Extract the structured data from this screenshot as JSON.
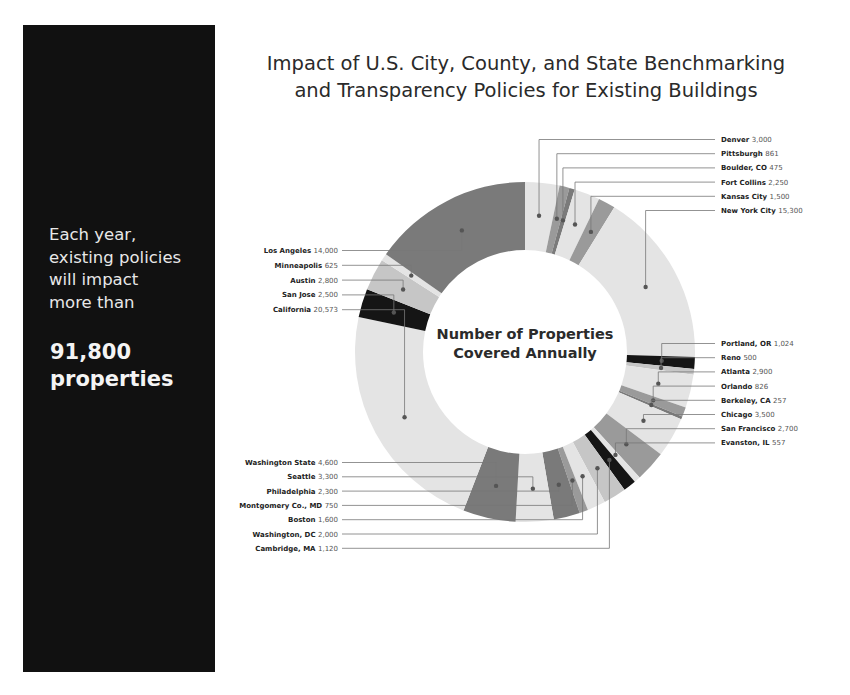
{
  "side_panel": {
    "text_lines": [
      "Each year,",
      "existing policies",
      "will impact",
      "more than"
    ],
    "highlight_lines": [
      "91,800",
      "properties"
    ],
    "background": "#111111"
  },
  "title": {
    "line1": "Impact of U.S. City, County, and State Benchmarking",
    "line2": "and Transparency Policies for Existing Buildings"
  },
  "center_label": {
    "line1": "Number of Properties",
    "line2": "Covered Annually"
  },
  "colors": {
    "light": "#e4e4e4",
    "lightmid": "#c6c6c6",
    "mid": "#9a9a9a",
    "dark": "#7a7a7a",
    "black": "#151515",
    "line": "#777777"
  },
  "chart_data": {
    "type": "pie",
    "variant": "donut",
    "title": "Impact of U.S. City, County, and State Benchmarking and Transparency Policies for Existing Buildings",
    "center_text": "Number of Properties Covered Annually",
    "total_stated": "91,800",
    "order": "clockwise from 12 o'clock",
    "segments": [
      {
        "name": "Denver",
        "value": 3000,
        "display": "3,000",
        "shade": "light"
      },
      {
        "name": "Pittsburgh",
        "value": 861,
        "display": "861",
        "shade": "mid"
      },
      {
        "name": "Boulder, CO",
        "value": 475,
        "display": "475",
        "shade": "dark"
      },
      {
        "name": "Fort Collins",
        "value": 2250,
        "display": "2,250",
        "shade": "light"
      },
      {
        "name": "Kansas City",
        "value": 1500,
        "display": "1,500",
        "shade": "mid"
      },
      {
        "name": "New York City",
        "value": 15300,
        "display": "15,300",
        "shade": "light"
      },
      {
        "name": "Portland, OR",
        "value": 1024,
        "display": "1,024",
        "shade": "black"
      },
      {
        "name": "Reno",
        "value": 500,
        "display": "500",
        "shade": "lightmid"
      },
      {
        "name": "Atlanta",
        "value": 2900,
        "display": "2,900",
        "shade": "light"
      },
      {
        "name": "Orlando",
        "value": 826,
        "display": "826",
        "shade": "mid"
      },
      {
        "name": "Berkeley, CA",
        "value": 257,
        "display": "257",
        "shade": "dark"
      },
      {
        "name": "Chicago",
        "value": 3500,
        "display": "3,500",
        "shade": "light"
      },
      {
        "name": "San Francisco",
        "value": 2700,
        "display": "2,700",
        "shade": "mid"
      },
      {
        "name": "Evanston, IL",
        "value": 557,
        "display": "557",
        "shade": "light"
      },
      {
        "name": "Cambridge, MA",
        "value": 1120,
        "display": "1,120",
        "shade": "black"
      },
      {
        "name": "Washington, DC",
        "value": 2000,
        "display": "2,000",
        "shade": "lightmid"
      },
      {
        "name": "Boston",
        "value": 1600,
        "display": "1,600",
        "shade": "light"
      },
      {
        "name": "Montgomery Co., MD",
        "value": 750,
        "display": "750",
        "shade": "mid"
      },
      {
        "name": "Philadelphia",
        "value": 2300,
        "display": "2,300",
        "shade": "dark"
      },
      {
        "name": "Seattle",
        "value": 3300,
        "display": "3,300",
        "shade": "light"
      },
      {
        "name": "Washington State",
        "value": 4600,
        "display": "4,600",
        "shade": "dark"
      },
      {
        "name": "California",
        "value": 20573,
        "display": "20,573",
        "shade": "light"
      },
      {
        "name": "San Jose",
        "value": 2500,
        "display": "2,500",
        "shade": "black"
      },
      {
        "name": "Austin",
        "value": 2800,
        "display": "2,800",
        "shade": "lightmid"
      },
      {
        "name": "Minneapolis",
        "value": 625,
        "display": "625",
        "shade": "light"
      },
      {
        "name": "Los Angeles",
        "value": 14000,
        "display": "14,000",
        "shade": "dark"
      }
    ],
    "labels_right_top": [
      "Denver",
      "Pittsburgh",
      "Boulder, CO",
      "Fort Collins",
      "Kansas City",
      "New York City"
    ],
    "labels_right_mid": [
      "Portland, OR",
      "Reno",
      "Atlanta",
      "Orlando",
      "Berkeley, CA",
      "Chicago",
      "San Francisco",
      "Evanston, IL"
    ],
    "labels_left_top": [
      "Los Angeles",
      "Minneapolis",
      "Austin",
      "San Jose",
      "California"
    ],
    "labels_left_bottom": [
      "Washington State",
      "Seattle",
      "Philadelphia",
      "Montgomery Co., MD",
      "Boston",
      "Washington, DC",
      "Cambridge, MA"
    ],
    "legend": "none (direct labels with leader lines)"
  }
}
